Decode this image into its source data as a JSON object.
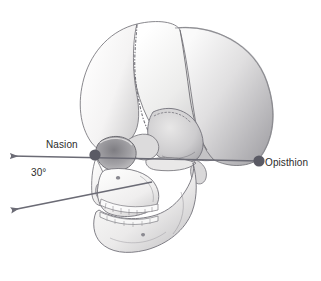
{
  "figure": {
    "kind": "anatomical-illustration",
    "background_color": "#ffffff"
  },
  "annotations": {
    "nasion": {
      "label": "Nasion",
      "point": {
        "x": 95,
        "y": 155
      },
      "dot_color": "#5a5a64"
    },
    "opisthion": {
      "label": "Opisthion",
      "point": {
        "x": 259,
        "y": 161
      },
      "dot_color": "#5a5a64"
    },
    "angle": {
      "label": "30°",
      "value": 30,
      "unit": "degrees"
    }
  },
  "lines": {
    "color": "#6b6b75",
    "horizontal_reference": {
      "name": "nasion-opisthion-line",
      "from": {
        "x": 259,
        "y": 161
      },
      "to": {
        "x": 11,
        "y": 156
      },
      "arrow_at": "to"
    },
    "angled_reference": {
      "name": "thirty-degree-line",
      "from": {
        "x": 148,
        "y": 179
      },
      "to": {
        "x": 12,
        "y": 210
      },
      "arrow_at": "to"
    }
  },
  "palette": {
    "bone_light": "#fbfbfa",
    "bone_mid": "#e3e2e1",
    "bone_shade": "#c2c1c2",
    "bone_deep": "#9a999c",
    "outline": "#6e6d72",
    "suture": "#77767b",
    "text": "#2b2b2b"
  }
}
